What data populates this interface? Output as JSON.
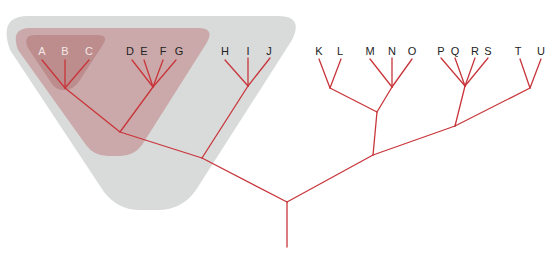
{
  "diagram": {
    "type": "phylogenetic-tree",
    "colors": {
      "branch": "#c8353a",
      "outer_group": "#d9dbdb",
      "middle_group": "#c9a3a4",
      "inner_group": "#b98485",
      "label_dark": "#222222",
      "label_light": "#f4e8e8"
    },
    "taxa": [
      {
        "id": "A",
        "label": "A",
        "x": 42,
        "y": 45,
        "style": "light"
      },
      {
        "id": "B",
        "label": "B",
        "x": 65,
        "y": 45,
        "style": "light"
      },
      {
        "id": "C",
        "label": "C",
        "x": 89,
        "y": 45,
        "style": "light"
      },
      {
        "id": "D",
        "label": "D",
        "x": 130,
        "y": 45,
        "style": "dark"
      },
      {
        "id": "E",
        "label": "E",
        "x": 144,
        "y": 45,
        "style": "dark"
      },
      {
        "id": "F",
        "label": "F",
        "x": 163,
        "y": 45,
        "style": "dark"
      },
      {
        "id": "G",
        "label": "G",
        "x": 179,
        "y": 45,
        "style": "dark"
      },
      {
        "id": "H",
        "label": "H",
        "x": 225,
        "y": 45,
        "style": "dark"
      },
      {
        "id": "I",
        "label": "I",
        "x": 248,
        "y": 45,
        "style": "dark"
      },
      {
        "id": "J",
        "label": "J",
        "x": 269,
        "y": 45,
        "style": "dark"
      },
      {
        "id": "K",
        "label": "K",
        "x": 319,
        "y": 45,
        "style": "dark"
      },
      {
        "id": "L",
        "label": "L",
        "x": 340,
        "y": 45,
        "style": "dark"
      },
      {
        "id": "M",
        "label": "M",
        "x": 370,
        "y": 45,
        "style": "dark"
      },
      {
        "id": "N",
        "label": "N",
        "x": 392,
        "y": 45,
        "style": "dark"
      },
      {
        "id": "O",
        "label": "O",
        "x": 412,
        "y": 45,
        "style": "dark"
      },
      {
        "id": "P",
        "label": "P",
        "x": 441,
        "y": 45,
        "style": "dark"
      },
      {
        "id": "Q",
        "label": "Q",
        "x": 455,
        "y": 45,
        "style": "dark"
      },
      {
        "id": "R",
        "label": "R",
        "x": 475,
        "y": 45,
        "style": "dark"
      },
      {
        "id": "S",
        "label": "S",
        "x": 488,
        "y": 45,
        "style": "dark"
      },
      {
        "id": "T",
        "label": "T",
        "x": 518,
        "y": 45,
        "style": "dark"
      },
      {
        "id": "U",
        "label": "U",
        "x": 541,
        "y": 45,
        "style": "dark"
      }
    ],
    "groups": [
      {
        "name": "outer-group-A-J",
        "members": [
          "A",
          "B",
          "C",
          "D",
          "E",
          "F",
          "G",
          "H",
          "I",
          "J"
        ]
      },
      {
        "name": "middle-group-A-G",
        "members": [
          "A",
          "B",
          "C",
          "D",
          "E",
          "F",
          "G"
        ]
      },
      {
        "name": "inner-group-A-C",
        "members": [
          "A",
          "B",
          "C"
        ]
      }
    ]
  }
}
